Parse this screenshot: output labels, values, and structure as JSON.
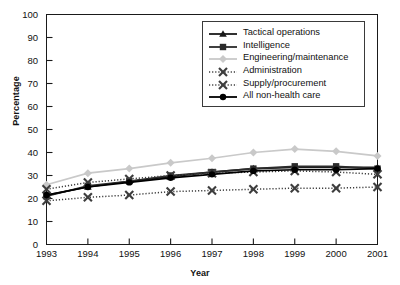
{
  "chart_data": {
    "type": "line",
    "title": "",
    "xlabel": "Year",
    "ylabel": "Percentage",
    "x": [
      1993,
      1994,
      1995,
      1996,
      1997,
      1998,
      1999,
      2000,
      2001
    ],
    "xtick_labels": [
      "1993",
      "1994",
      "1995",
      "1996",
      "1997",
      "1998",
      "1999",
      "2000",
      "2001"
    ],
    "ytick_labels": [
      "0",
      "10",
      "20",
      "30",
      "40",
      "50",
      "60",
      "70",
      "80",
      "90",
      "100"
    ],
    "ylim": [
      0,
      100
    ],
    "xlim": [
      1993,
      2001
    ],
    "grid": false,
    "legend_position": "top-right",
    "series": [
      {
        "name": "Tactical operations",
        "marker": "triangle",
        "line": "solid",
        "color": "#1a1a1a",
        "values": [
          21.5,
          25.0,
          27.5,
          29.5,
          31.5,
          33.0,
          33.5,
          33.5,
          33.5
        ]
      },
      {
        "name": "Intelligence",
        "marker": "square",
        "line": "solid",
        "color": "#2b2b2b",
        "values": [
          21.0,
          25.5,
          27.5,
          30.0,
          31.5,
          33.0,
          34.0,
          34.0,
          33.0
        ]
      },
      {
        "name": "Engineering/maintenance",
        "marker": "diamond",
        "line": "solid",
        "color": "#c9c9c9",
        "values": [
          26.0,
          31.0,
          33.0,
          35.5,
          37.5,
          40.0,
          41.5,
          40.5,
          38.5
        ]
      },
      {
        "name": "Administration",
        "marker": "x",
        "line": "dotted",
        "color": "#3d3d3d",
        "values": [
          24.0,
          27.0,
          28.5,
          30.0,
          31.0,
          31.5,
          32.0,
          31.5,
          30.5
        ]
      },
      {
        "name": "Supply/procurement",
        "marker": "x",
        "line": "dotted",
        "color": "#3d3d3d",
        "values": [
          19.0,
          20.5,
          21.5,
          23.0,
          23.5,
          24.0,
          24.5,
          24.5,
          25.0
        ]
      },
      {
        "name": "All non-health care",
        "marker": "circle",
        "line": "solid",
        "color": "#000000",
        "values": [
          21.5,
          25.0,
          27.0,
          29.0,
          30.5,
          32.0,
          32.5,
          32.5,
          33.0
        ]
      }
    ]
  },
  "legend": {
    "items": [
      {
        "label": "Tactical operations"
      },
      {
        "label": "Intelligence"
      },
      {
        "label": "Engineering/maintenance"
      },
      {
        "label": "Administration"
      },
      {
        "label": "Supply/procurement"
      },
      {
        "label": "All non-health care"
      }
    ]
  }
}
